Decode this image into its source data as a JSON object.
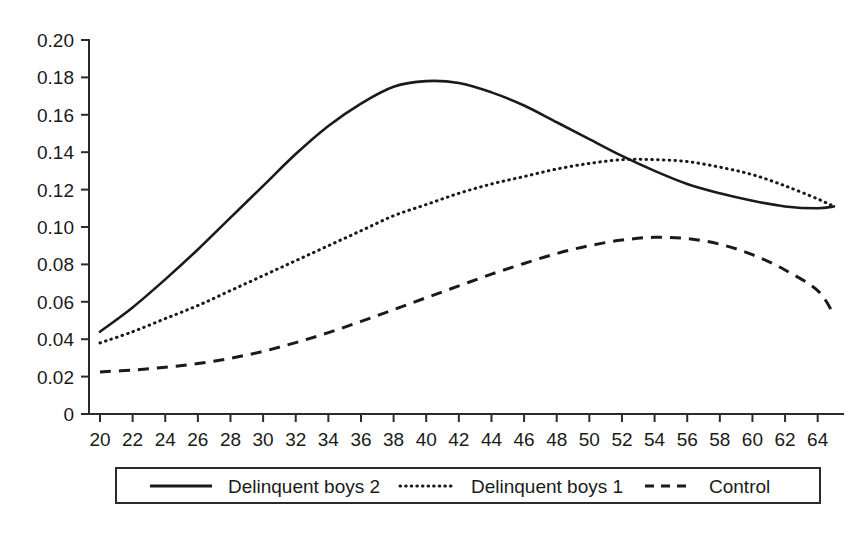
{
  "chart_data": {
    "type": "line",
    "title": "",
    "subtitle": "",
    "xlabel": "",
    "ylabel": "",
    "xlim": [
      20,
      65
    ],
    "ylim": [
      0,
      0.2
    ],
    "grid": false,
    "legend_position": "bottom",
    "x_ticks": [
      20,
      22,
      24,
      26,
      28,
      30,
      32,
      34,
      36,
      38,
      40,
      42,
      44,
      46,
      48,
      50,
      52,
      54,
      56,
      58,
      60,
      62,
      64
    ],
    "x_tick_labels": [
      "20",
      "22",
      "24",
      "26",
      "28",
      "30",
      "32",
      "34",
      "36",
      "38",
      "40",
      "42",
      "44",
      "46",
      "48",
      "50",
      "52",
      "54",
      "56",
      "58",
      "60",
      "62",
      "64"
    ],
    "y_ticks": [
      0,
      0.02,
      0.04,
      0.06,
      0.08,
      0.1,
      0.12,
      0.14,
      0.16,
      0.18,
      0.2
    ],
    "y_tick_labels": [
      "0",
      "0.02",
      "0.04",
      "0.06",
      "0.08",
      "0.10",
      "0.12",
      "0.14",
      "0.16",
      "0.18",
      "0.20"
    ],
    "x": [
      20,
      22,
      24,
      26,
      28,
      30,
      32,
      34,
      36,
      38,
      40,
      42,
      44,
      46,
      48,
      50,
      52,
      54,
      56,
      58,
      60,
      62,
      64,
      65
    ],
    "series": [
      {
        "name": "Delinquent boys 2",
        "style": "solid",
        "color": "#1a1a1a",
        "values": [
          0.044,
          0.057,
          0.072,
          0.088,
          0.105,
          0.122,
          0.139,
          0.154,
          0.166,
          0.175,
          0.178,
          0.177,
          0.172,
          0.165,
          0.156,
          0.147,
          0.138,
          0.13,
          0.123,
          0.118,
          0.114,
          0.111,
          0.11,
          0.111
        ]
      },
      {
        "name": "Delinquent boys 1",
        "style": "dotted",
        "color": "#1a1a1a",
        "values": [
          0.038,
          0.044,
          0.051,
          0.058,
          0.066,
          0.074,
          0.082,
          0.09,
          0.098,
          0.106,
          0.112,
          0.118,
          0.123,
          0.127,
          0.131,
          0.134,
          0.136,
          0.136,
          0.135,
          0.132,
          0.128,
          0.122,
          0.115,
          0.111
        ]
      },
      {
        "name": "Control",
        "style": "dashed",
        "color": "#1a1a1a",
        "values": [
          0.0225,
          0.0235,
          0.025,
          0.027,
          0.0298,
          0.0335,
          0.0382,
          0.0435,
          0.0495,
          0.0558,
          0.0622,
          0.0685,
          0.0748,
          0.0805,
          0.0858,
          0.09,
          0.093,
          0.0945,
          0.0938,
          0.0908,
          0.0852,
          0.077,
          0.066,
          0.053
        ]
      }
    ]
  },
  "legend": {
    "items": [
      {
        "label": "Delinquent boys 2",
        "style": "solid"
      },
      {
        "label": "Delinquent boys 1",
        "style": "dotted"
      },
      {
        "label": "Control",
        "style": "dashed"
      }
    ]
  }
}
